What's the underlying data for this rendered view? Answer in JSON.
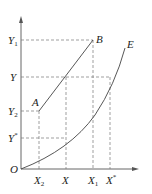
{
  "diagram": {
    "origin_label": "O",
    "y_axis_labels": [
      {
        "id": "Y1",
        "base": "Y",
        "sub": "1",
        "y": 40
      },
      {
        "id": "Y",
        "base": "Y",
        "sub": "",
        "y": 77
      },
      {
        "id": "Y2",
        "base": "Y",
        "sub": "2",
        "y": 111
      },
      {
        "id": "Ystar",
        "base": "Y",
        "sup": "*",
        "y": 138
      }
    ],
    "x_axis_labels": [
      {
        "id": "X2",
        "base": "X",
        "sub": "2",
        "x": 39
      },
      {
        "id": "X",
        "base": "X",
        "sub": "",
        "x": 66
      },
      {
        "id": "X1",
        "base": "X",
        "sub": "1",
        "x": 93
      },
      {
        "id": "Xstar",
        "base": "X",
        "sup": "*",
        "x": 110
      }
    ],
    "points": [
      {
        "id": "A",
        "label": "A",
        "x": 39,
        "y": 111
      },
      {
        "id": "B",
        "label": "B",
        "x": 93,
        "y": 40
      }
    ],
    "curves": [
      {
        "id": "AB",
        "label": "",
        "description": "line from A to B"
      },
      {
        "id": "E",
        "label": "E",
        "description": "convex curve from origin"
      }
    ],
    "labels": {
      "O": "O",
      "A": "A",
      "B": "B",
      "E": "E",
      "Y1_base": "Y",
      "Y1_sub": "1",
      "Y_base": "Y",
      "Y2_base": "Y",
      "Y2_sub": "2",
      "Ystar_base": "Y",
      "Ystar_sup": "*",
      "X2_base": "X",
      "X2_sub": "2",
      "X_base": "X",
      "X1_base": "X",
      "X1_sub": "1",
      "Xstar_base": "X",
      "Xstar_sup": "*"
    }
  }
}
